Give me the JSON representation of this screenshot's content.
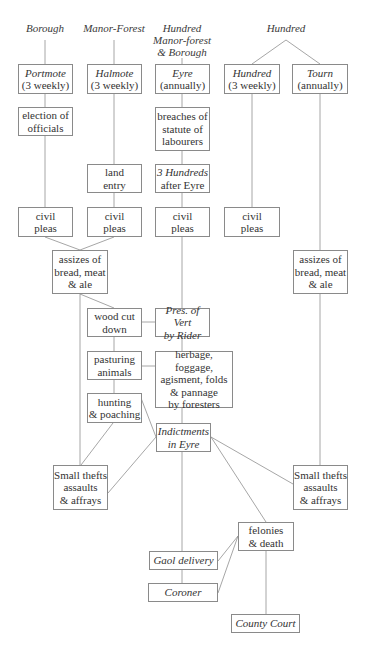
{
  "headers": {
    "borough": "Borough",
    "manor_forest": "Manor-Forest",
    "hundred_mfb": [
      "Hundred",
      "Manor-forest",
      "& Borough"
    ],
    "hundred": "Hundred"
  },
  "boxes": {
    "portmote": {
      "title": "Portmote",
      "sub": "(3 weekly)"
    },
    "halmote": {
      "title": "Halmote",
      "sub": "(3 weekly)"
    },
    "eyre": {
      "title": "Eyre",
      "sub": "(annually)"
    },
    "hundred_court": {
      "title": "Hundred",
      "sub": "(3 weekly)"
    },
    "tourn": {
      "title": "Tourn",
      "sub": "(annually)"
    },
    "election": {
      "lines": [
        "election of",
        "officials"
      ]
    },
    "breaches": {
      "lines": [
        "breaches of",
        "statute of",
        "labourers"
      ]
    },
    "land_entry": {
      "lines": [
        "land",
        "entry"
      ]
    },
    "three_hundreds": {
      "title": "3 Hundreds",
      "sub": "after Eyre"
    },
    "civil1": {
      "lines": [
        "civil",
        "pleas"
      ]
    },
    "civil2": {
      "lines": [
        "civil",
        "pleas"
      ]
    },
    "civil3": {
      "lines": [
        "civil",
        "pleas"
      ]
    },
    "civil4": {
      "lines": [
        "civil",
        "pleas"
      ]
    },
    "assizes_left": {
      "lines": [
        "assizes of",
        "bread, meat",
        "& ale"
      ]
    },
    "assizes_right": {
      "lines": [
        "assizes of",
        "bread, meat",
        "& ale"
      ]
    },
    "wood": {
      "lines": [
        "wood cut",
        "down"
      ]
    },
    "pres_vert": {
      "lines": [
        "Pres. of Vert",
        "by Rider"
      ]
    },
    "pasturing": {
      "lines": [
        "pasturing",
        "animals"
      ]
    },
    "herbage": {
      "lines": [
        "herbage, foggage,",
        "agisment, folds",
        "& pannage",
        "by foresters"
      ]
    },
    "hunting": {
      "lines": [
        "hunting",
        "& poaching"
      ]
    },
    "indictments": {
      "lines": [
        "Indictments",
        "in Eyre"
      ]
    },
    "thefts_left": {
      "lines": [
        "Small thefts",
        "assaults",
        "& affrays"
      ]
    },
    "thefts_right": {
      "lines": [
        "Small thefts",
        "assaults",
        "& affrays"
      ]
    },
    "felonies": {
      "lines": [
        "felonies",
        "& death"
      ]
    },
    "gaol": {
      "label": "Gaol delivery"
    },
    "coroner": {
      "label": "Coroner"
    },
    "county": {
      "label": "County Court"
    }
  },
  "colors": {
    "line": "#8a8a8a",
    "text": "#333333"
  }
}
